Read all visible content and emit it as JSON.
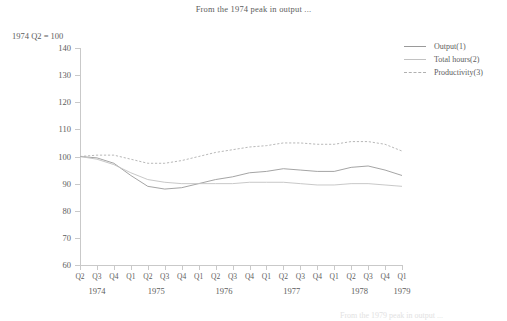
{
  "title": "From the 1974 peak in output ...",
  "axis_note": "1974 Q2 = 100",
  "footer_note": "From the 1979 peak in output ...",
  "legend": {
    "items": [
      {
        "label": "Output(1)",
        "color": "#9a9a9a",
        "style": "solid"
      },
      {
        "label": "Total hours(2)",
        "color": "#c2c2c2",
        "style": "solid"
      },
      {
        "label": "Productivity(3)",
        "color": "#b0b0b0",
        "style": "dashed"
      }
    ]
  },
  "chart_data": {
    "type": "line",
    "title": "From the 1974 peak in output ...",
    "xlabel": "",
    "ylabel": "1974 Q2 = 100",
    "ylim": [
      60,
      140
    ],
    "yticks": [
      60,
      70,
      80,
      90,
      100,
      110,
      120,
      130,
      140
    ],
    "grid": false,
    "legend_position": "top-right",
    "x": [
      "Q2",
      "Q3",
      "Q4",
      "Q1",
      "Q2",
      "Q3",
      "Q4",
      "Q1",
      "Q2",
      "Q3",
      "Q4",
      "Q1",
      "Q2",
      "Q3",
      "Q4",
      "Q1",
      "Q2",
      "Q3",
      "Q4",
      "Q1"
    ],
    "year_groups": [
      {
        "label": "1974",
        "start_index": 0,
        "span": 3
      },
      {
        "label": "1975",
        "start_index": 3,
        "span": 4
      },
      {
        "label": "1976",
        "start_index": 7,
        "span": 4
      },
      {
        "label": "1977",
        "start_index": 11,
        "span": 4
      },
      {
        "label": "1978",
        "start_index": 15,
        "span": 4
      },
      {
        "label": "1979",
        "start_index": 19,
        "span": 1
      }
    ],
    "series": [
      {
        "name": "Output(1)",
        "color": "#9a9a9a",
        "style": "solid",
        "values": [
          100,
          99.5,
          97.5,
          93,
          89,
          88,
          88.5,
          90,
          91.5,
          92.5,
          94,
          94.5,
          95.5,
          95,
          94.5,
          94.5,
          96,
          96.5,
          95,
          93
        ]
      },
      {
        "name": "Total hours(2)",
        "color": "#c2c2c2",
        "style": "solid",
        "values": [
          100,
          99,
          97,
          94,
          91.5,
          90.5,
          90,
          90,
          90,
          90,
          90.5,
          90.5,
          90.5,
          90,
          89.5,
          89.5,
          90,
          90,
          89.5,
          89
        ]
      },
      {
        "name": "Productivity(3)",
        "color": "#b0b0b0",
        "style": "dashed",
        "values": [
          100,
          100.5,
          100.5,
          99,
          97.5,
          97.5,
          98.5,
          100,
          101.5,
          102.5,
          103.5,
          104,
          105,
          105,
          104.5,
          104.5,
          105.5,
          105.5,
          104.5,
          102
        ]
      }
    ]
  }
}
